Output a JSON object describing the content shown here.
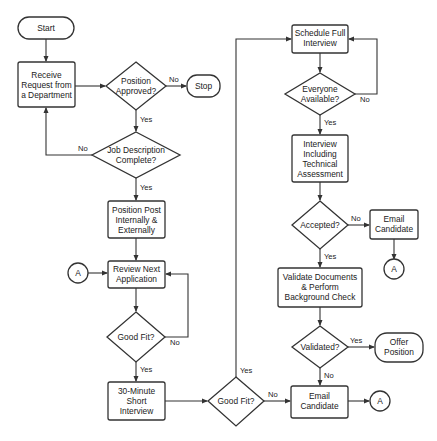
{
  "diagram": {
    "type": "flowchart",
    "nodes": {
      "start": {
        "shape": "terminator",
        "lines": [
          "Start"
        ]
      },
      "receive": {
        "shape": "process",
        "lines": [
          "Receive",
          "Request from",
          "a Department"
        ]
      },
      "approved": {
        "shape": "decision",
        "lines": [
          "Position",
          "Approved?"
        ]
      },
      "stop": {
        "shape": "terminator",
        "lines": [
          "Stop"
        ]
      },
      "jobdesc": {
        "shape": "decision",
        "lines": [
          "Job Description",
          "Complete?"
        ]
      },
      "post": {
        "shape": "process",
        "lines": [
          "Position Post",
          "Internally &",
          "Externally"
        ]
      },
      "connA1": {
        "shape": "connector",
        "lines": [
          "A"
        ]
      },
      "review": {
        "shape": "process",
        "lines": [
          "Review Next",
          "Application"
        ]
      },
      "goodfit1": {
        "shape": "decision",
        "lines": [
          "Good Fit?"
        ]
      },
      "short": {
        "shape": "process",
        "lines": [
          "30-Minute",
          "Short",
          "Interview"
        ]
      },
      "goodfit2": {
        "shape": "decision",
        "lines": [
          "Good Fit?"
        ]
      },
      "schedule": {
        "shape": "process",
        "lines": [
          "Schedule Full",
          "Interview"
        ]
      },
      "everyone": {
        "shape": "decision",
        "lines": [
          "Everyone",
          "Available?"
        ]
      },
      "interview": {
        "shape": "process",
        "lines": [
          "Interview",
          "Including",
          "Technical",
          "Assessment"
        ]
      },
      "accepted": {
        "shape": "decision",
        "lines": [
          "Accepted?"
        ]
      },
      "email1": {
        "shape": "process",
        "lines": [
          "Email",
          "Candidate"
        ]
      },
      "connA2": {
        "shape": "connector",
        "lines": [
          "A"
        ]
      },
      "validate": {
        "shape": "process",
        "lines": [
          "Validate Documents",
          "& Perform",
          "Background Check"
        ]
      },
      "validated": {
        "shape": "decision",
        "lines": [
          "Validated?"
        ]
      },
      "offer": {
        "shape": "terminator",
        "lines": [
          "Offer",
          "Position"
        ]
      },
      "email2": {
        "shape": "process",
        "lines": [
          "Email",
          "Candidate"
        ]
      },
      "connA3": {
        "shape": "connector",
        "lines": [
          "A"
        ]
      }
    },
    "edge_labels": {
      "approved_no": "No",
      "approved_yes": "Yes",
      "jobdesc_no": "No",
      "jobdesc_yes": "Yes",
      "goodfit1_no": "No",
      "goodfit1_yes": "Yes",
      "goodfit2_yes": "Yes",
      "goodfit2_no": "No",
      "everyone_no": "No",
      "everyone_yes": "Yes",
      "accepted_no": "No",
      "accepted_yes": "Yes",
      "validated_yes": "Yes",
      "validated_no": "No"
    },
    "colors": {
      "stroke": "#333333",
      "fill": "#ffffff",
      "text": "#222222"
    }
  }
}
